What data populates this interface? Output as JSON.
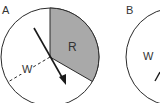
{
  "figure": {
    "panels": [
      {
        "label": "A",
        "sectors": [
          {
            "name": "R",
            "label": "R",
            "shaded": true,
            "fill": "#a9a9a9"
          },
          {
            "name": "W",
            "label": "W",
            "shaded": false,
            "fill": "#ffffff"
          }
        ],
        "arrow": "spinner-arrow"
      },
      {
        "label": "B",
        "sectors": [
          {
            "name": "W",
            "label": "W",
            "shaded": false,
            "fill": "#ffffff"
          }
        ]
      }
    ],
    "colors": {
      "stroke": "#2a2a2a",
      "shaded": "#a9a9a9",
      "background": "#ffffff"
    }
  }
}
